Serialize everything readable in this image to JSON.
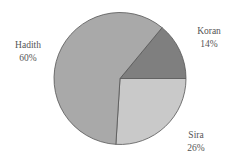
{
  "chart_data": {
    "type": "pie",
    "title": "",
    "categories": [
      "Koran",
      "Sira",
      "Hadith"
    ],
    "values": [
      14,
      26,
      60
    ],
    "unit": "%",
    "start_angle_deg": 0,
    "direction": "mixed: Koran counterclockwise from 3 o'clock, Sira clockwise from 3 o'clock",
    "colors": [
      "#7f7f7f",
      "#c9c9c9",
      "#a9a9a9"
    ],
    "legend": "none (direct labels)",
    "slices": [
      {
        "label": "Koran",
        "value": 14,
        "value_label": "14%",
        "color": "#7f7f7f"
      },
      {
        "label": "Sira",
        "value": 26,
        "value_label": "26%",
        "color": "#c9c9c9"
      },
      {
        "label": "Hadith",
        "value": 60,
        "value_label": "60%",
        "color": "#a9a9a9"
      }
    ]
  },
  "labels": {
    "koran": {
      "name": "Koran",
      "pct": "14%"
    },
    "sira": {
      "name": "Sira",
      "pct": "26%"
    },
    "hadith": {
      "name": "Hadith",
      "pct": "60%"
    }
  },
  "colors": {
    "edge": "#555555",
    "background": "#ffffff"
  }
}
